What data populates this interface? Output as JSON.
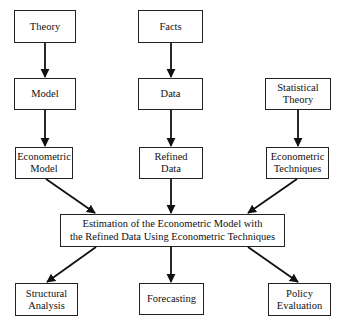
{
  "diagram": {
    "type": "flowchart",
    "nodes": {
      "theory": {
        "label": "Theory"
      },
      "facts": {
        "label": "Facts"
      },
      "model": {
        "label": "Model"
      },
      "data": {
        "label": "Data"
      },
      "statistical_theory": {
        "label": "Statistical\nTheory"
      },
      "econometric_model": {
        "label": "Econometric\nModel"
      },
      "refined_data": {
        "label": "Refined\nData"
      },
      "econometric_techniques": {
        "label": "Econometric\nTechniques"
      },
      "estimation": {
        "label": "Estimation of the Econometric Model with\nthe Refined Data Using Econometric Techniques"
      },
      "structural_analysis": {
        "label": "Structural\nAnalysis"
      },
      "forecasting": {
        "label": "Forecasting"
      },
      "policy_evaluation": {
        "label": "Policy\nEvaluation"
      }
    },
    "edges": [
      {
        "from": "theory",
        "to": "model"
      },
      {
        "from": "facts",
        "to": "data"
      },
      {
        "from": "model",
        "to": "econometric_model"
      },
      {
        "from": "data",
        "to": "refined_data"
      },
      {
        "from": "statistical_theory",
        "to": "econometric_techniques"
      },
      {
        "from": "econometric_model",
        "to": "estimation"
      },
      {
        "from": "refined_data",
        "to": "estimation"
      },
      {
        "from": "econometric_techniques",
        "to": "estimation"
      },
      {
        "from": "estimation",
        "to": "structural_analysis"
      },
      {
        "from": "estimation",
        "to": "forecasting"
      },
      {
        "from": "estimation",
        "to": "policy_evaluation"
      }
    ],
    "colors": {
      "line": "#111111",
      "box_border": "#222222",
      "background": "#ffffff"
    }
  }
}
